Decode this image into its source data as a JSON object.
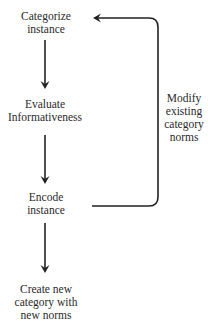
{
  "diagram": {
    "nodes": [
      {
        "id": "categorize",
        "lines": [
          "Categorize",
          "instance"
        ]
      },
      {
        "id": "evaluate",
        "lines": [
          "Evaluate",
          "Informativeness"
        ]
      },
      {
        "id": "encode",
        "lines": [
          "Encode",
          "instance"
        ]
      },
      {
        "id": "create",
        "lines": [
          "Create new",
          "category with",
          "new norms"
        ]
      }
    ],
    "feedback_label": {
      "lines": [
        "Modify",
        "existing",
        "category",
        "norms"
      ]
    },
    "edges": [
      {
        "from": "categorize",
        "to": "evaluate",
        "type": "arrow-down"
      },
      {
        "from": "evaluate",
        "to": "encode",
        "type": "arrow-down"
      },
      {
        "from": "encode",
        "to": "create",
        "type": "arrow-down"
      },
      {
        "from": "encode",
        "to": "categorize",
        "type": "feedback-loop",
        "label": "Modify existing category norms"
      }
    ],
    "colors": {
      "line": "#222222",
      "text": "#2a2a2a",
      "background": "#ffffff"
    }
  }
}
